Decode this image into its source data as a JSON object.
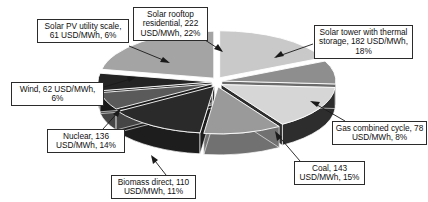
{
  "chart_data": {
    "type": "pie",
    "title": "",
    "subtitle": "",
    "xlabel": "",
    "ylabel": "",
    "legend_position": "none",
    "grid": false,
    "value_unit": "USD/MWh",
    "three_d": true,
    "exploded": true,
    "start_angle_deg": 0,
    "direction": "clockwise",
    "categories": [
      "Solar tower with thermal storage",
      "Gas combined cycle",
      "Coal",
      "Biomass direct",
      "Nuclear",
      "Wind",
      "Solar PV utility scale",
      "Solar rooftop residential"
    ],
    "values": [
      182,
      78,
      143,
      110,
      136,
      62,
      61,
      222
    ],
    "percentages": [
      18,
      8,
      15,
      11,
      14,
      6,
      6,
      22
    ],
    "colors": [
      "#c9c9c9",
      "#8e8e8e",
      "#d6d6d6",
      "#9a9a9a",
      "#2a2a2a",
      "#5a5a5a",
      "#242424",
      "#a4a4a4"
    ],
    "slices": [
      {
        "label": "Solar tower with thermal storage",
        "value": 182,
        "percent": 18,
        "color": "#c9c9c9",
        "side_color": "#9c9c9c"
      },
      {
        "label": "Gas combined cycle",
        "value": 78,
        "percent": 8,
        "color": "#8e8e8e",
        "side_color": "#6b6b6b"
      },
      {
        "label": "Coal",
        "value": 143,
        "percent": 15,
        "color": "#d6d6d6",
        "side_color": "#2d2d2d"
      },
      {
        "label": "Biomass direct",
        "value": 110,
        "percent": 11,
        "color": "#9a9a9a",
        "side_color": "#717171"
      },
      {
        "label": "Nuclear",
        "value": 136,
        "percent": 14,
        "color": "#2a2a2a",
        "side_color": "#1d1d1d"
      },
      {
        "label": "Wind",
        "value": 62,
        "percent": 6,
        "color": "#5a5a5a",
        "side_color": "#454545"
      },
      {
        "label": "Solar PV utility scale",
        "value": 61,
        "percent": 6,
        "color": "#242424",
        "side_color": "#191919"
      },
      {
        "label": "Solar rooftop residential",
        "value": 222,
        "percent": 22,
        "color": "#a4a4a4",
        "side_color": "#7d7d7d"
      }
    ]
  },
  "callouts": {
    "rooftop": "Solar rooftop residential, 222 USD/MWh, 22%",
    "tower": "Solar tower with thermal storage, 182 USD/MWh, 18%",
    "pv_utility": "Solar PV utility scale, 61 USD/MWh, 6%",
    "wind": "Wind, 62 USD/MWh, 6%",
    "nuclear": "Nuclear, 136 USD/MWh, 14%",
    "biomass": "Biomass direct, 110 USD/MWh, 11%",
    "coal": "Coal, 143 USD/MWh, 15%",
    "gas": "Gas combined cycle, 78 USD/MWh, 8%"
  }
}
